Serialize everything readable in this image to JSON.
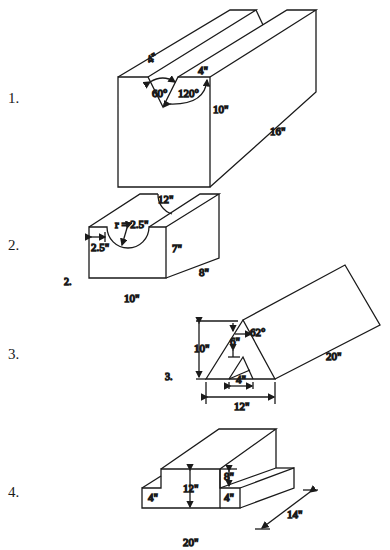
{
  "problems": [
    {
      "number": "1.",
      "shape": "block-with-v-groove",
      "labels": {
        "top_left_width": "4\"",
        "top_right_width": "4\"",
        "groove_angle": "60°",
        "outer_angle": "120°",
        "height": "10\"",
        "length": "16\"",
        "width": "12\""
      }
    },
    {
      "number": "2.",
      "inner_number": "2.",
      "shape": "block-with-semicircular-groove",
      "labels": {
        "radius": "r = 2.5\"",
        "offset": "2.5\"",
        "height": "7\"",
        "length": "8\"",
        "width": "10\""
      }
    },
    {
      "number": "3.",
      "inner_number": "3.",
      "shape": "triangular-prism-with-triangular-hole",
      "labels": {
        "height": "10\"",
        "inner_offset": "6\"",
        "angle": "62°",
        "length": "20\"",
        "inner_base": "4\"",
        "base": "12\""
      }
    },
    {
      "number": "4.",
      "shape": "t-shaped-block",
      "labels": {
        "height": "12\"",
        "step_height": "8\"",
        "left_base_height": "4\"",
        "right_base_height": "4\"",
        "length": "14\"",
        "width": "20\""
      }
    }
  ]
}
